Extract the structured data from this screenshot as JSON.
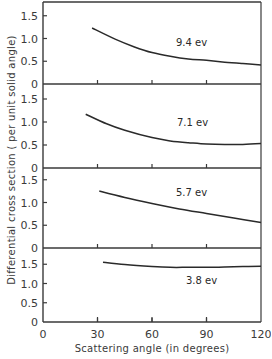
{
  "chart_data": {
    "type": "line",
    "title": "",
    "xlabel": "Scattering angle (in degrees)",
    "ylabel": "Differential cross section ( per unit solid angle)",
    "xlim": [
      0,
      120
    ],
    "x_ticks": [
      0,
      30,
      60,
      90,
      120
    ],
    "x_tick_labels": [
      "0",
      "30",
      "60",
      "90",
      "120"
    ],
    "grid": false,
    "layout": "4 vertically stacked panels sharing x-axis",
    "panels": [
      {
        "label": "9.4 ev",
        "ylim": [
          0,
          1.8
        ],
        "y_ticks": [
          0,
          0.5,
          1.0,
          1.5
        ],
        "y_tick_labels": [
          "0",
          "0.5",
          "1.0",
          "1.5"
        ],
        "series": [
          {
            "name": "9.4 ev",
            "x": [
              27,
              40,
              50,
              60,
              70,
              80,
              90,
              100,
              110,
              120
            ],
            "y": [
              1.23,
              0.98,
              0.82,
              0.69,
              0.61,
              0.55,
              0.52,
              0.48,
              0.45,
              0.42
            ]
          }
        ]
      },
      {
        "label": "7.1 ev",
        "ylim": [
          0,
          1.85
        ],
        "y_ticks": [
          0,
          0.5,
          1.0,
          1.5
        ],
        "y_tick_labels": [
          "0",
          "0.5",
          "1.0",
          "1.5"
        ],
        "series": [
          {
            "name": "7.1 ev",
            "x": [
              23.5,
              35,
              45,
              60,
              70,
              80,
              90,
              100,
              110,
              120
            ],
            "y": [
              1.17,
              0.96,
              0.82,
              0.66,
              0.59,
              0.55,
              0.52,
              0.51,
              0.51,
              0.53
            ]
          }
        ]
      },
      {
        "label": "5.7 ev",
        "ylim": [
          0,
          1.8
        ],
        "y_ticks": [
          0,
          0.5,
          1.0,
          1.5
        ],
        "y_tick_labels": [
          "0",
          "0.5",
          "1.0",
          "1.5"
        ],
        "series": [
          {
            "name": "5.7 ev",
            "x": [
              31,
              45,
              60,
              75,
              90,
              105,
              120
            ],
            "y": [
              1.25,
              1.11,
              0.98,
              0.86,
              0.76,
              0.66,
              0.56
            ]
          }
        ]
      },
      {
        "label": "3.8 ev",
        "ylim": [
          0,
          1.55
        ],
        "y_ticks": [
          0,
          0.5,
          1.0,
          1.5
        ],
        "y_tick_labels": [
          "0",
          "0.5",
          "1.0",
          "1.5"
        ],
        "series": [
          {
            "name": "3.8 ev",
            "x": [
              33,
              45,
              60,
              70,
              80,
              90,
              100,
              110,
              120
            ],
            "y": [
              1.55,
              1.49,
              1.44,
              1.42,
              1.42,
              1.42,
              1.43,
              1.44,
              1.45
            ]
          }
        ]
      }
    ]
  },
  "geometry": {
    "x0_px": 43,
    "x120_px": 261,
    "panels_px": [
      {
        "top": 2,
        "baseline": 84,
        "px_per_unit": 45.5
      },
      {
        "top": 84,
        "baseline": 168,
        "px_per_unit": 46
      },
      {
        "top": 168,
        "baseline": 248,
        "px_per_unit": 45.5
      },
      {
        "top": 248,
        "baseline": 322,
        "px_per_unit": 38.5
      }
    ],
    "label_pos": [
      [
        176,
        46
      ],
      [
        177,
        126
      ],
      [
        176,
        196
      ],
      [
        186,
        284
      ]
    ]
  },
  "colors": {
    "line": "#2a2a2a",
    "axis": "#3a3a3a",
    "background": "#ffffff"
  }
}
